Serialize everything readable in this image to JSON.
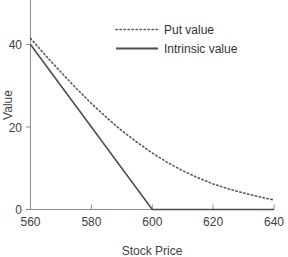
{
  "chart_data": {
    "type": "line",
    "title": "",
    "subtitle": "",
    "xlabel": "Stock  Price",
    "ylabel": "Value",
    "xlim": [
      560,
      640
    ],
    "ylim": [
      0,
      44
    ],
    "xticks": [
      560,
      580,
      600,
      620,
      640
    ],
    "yticks": [
      0,
      20,
      40
    ],
    "xtick_labels": [
      "560",
      "580",
      "600",
      "620",
      "640"
    ],
    "ytick_labels": [
      "0",
      "20",
      "40"
    ],
    "grid": false,
    "legend_position": "top-right",
    "series": [
      {
        "name": "Put value",
        "style": "dotted",
        "color": "#595959",
        "x": [
          560,
          565,
          570,
          575,
          580,
          585,
          590,
          595,
          600,
          605,
          610,
          615,
          620,
          625,
          630,
          635,
          640
        ],
        "values": [
          41.5,
          37.3,
          33.3,
          29.4,
          25.7,
          22.3,
          19.1,
          16.3,
          13.7,
          11.4,
          9.4,
          7.7,
          6.2,
          5.0,
          4.0,
          3.1,
          2.3
        ]
      },
      {
        "name": "Intrinsic value",
        "style": "solid",
        "color": "#4d4d4d",
        "x": [
          560,
          600,
          640
        ],
        "values": [
          40,
          0,
          0
        ]
      }
    ]
  },
  "axes": {
    "y_axis_label": "Value",
    "x_axis_label": "Stock  Price",
    "y_ticks": [
      {
        "label": "40",
        "value": 40
      },
      {
        "label": "20",
        "value": 20
      },
      {
        "label": "0",
        "value": 0
      }
    ],
    "x_ticks": [
      {
        "label": "560",
        "value": 560
      },
      {
        "label": "580",
        "value": 580
      },
      {
        "label": "600",
        "value": 600
      },
      {
        "label": "620",
        "value": 620
      },
      {
        "label": "640",
        "value": 640
      }
    ]
  },
  "legend": {
    "entries": [
      {
        "label": "Put value",
        "style": "dotted"
      },
      {
        "label": "Intrinsic value",
        "style": "solid"
      }
    ]
  },
  "colors": {
    "axis": "#8c8c8c",
    "put_series": "#595959",
    "intrinsic_series": "#4d4d4d",
    "text": "#404040",
    "background": "#ffffff"
  }
}
